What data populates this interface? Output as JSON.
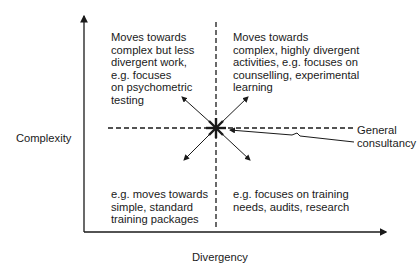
{
  "axes": {
    "y_label": "Complexity",
    "x_label": "Divergency"
  },
  "quadrants": {
    "top_left": "Moves towards\ncomplex but less\ndivergent work,\ne.g. focuses\non psychometric\ntesting",
    "top_right": "Moves towards\ncomplex, highly divergent\nactivities, e.g. focuses on\ncounselling, experimental\nlearning",
    "bottom_left": "e.g. moves towards\nsimple, standard\ntraining packages",
    "bottom_right": "e.g. focuses on training\nneeds, audits, research"
  },
  "center": {
    "label": "General\nconsultancy",
    "marker": "asterisk-star"
  },
  "colors": {
    "line": "#1a1a1a",
    "background": "#ffffff"
  }
}
